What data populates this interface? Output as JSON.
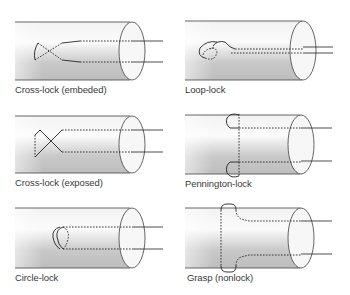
{
  "figure": {
    "panels": [
      {
        "id": "cross-lock-embedded",
        "label": "Cross-lock (embeded)"
      },
      {
        "id": "loop-lock",
        "label": "Loop-lock"
      },
      {
        "id": "cross-lock-exposed",
        "label": "Cross-lock (exposed)"
      },
      {
        "id": "pennington-lock",
        "label": "Pennington-lock"
      },
      {
        "id": "circle-lock",
        "label": "Circle-lock"
      },
      {
        "id": "grasp-nonlock",
        "label": "Grasp (nonlock)"
      }
    ],
    "colors": {
      "tube_light": "#f4f4f4",
      "tube_dark": "#b9b9b9",
      "cap_fill": "#f7f7f7",
      "outline": "#555555",
      "suture": "#222222"
    }
  }
}
